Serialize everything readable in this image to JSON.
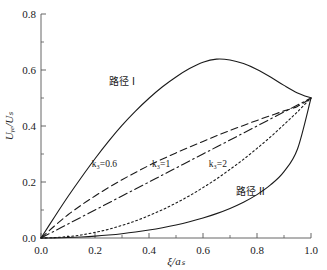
{
  "chart_data": {
    "type": "line",
    "title": "",
    "xlabel": "ξ/aₛ",
    "ylabel": "Uᵧₑ/Uₛ",
    "xlim": [
      0.0,
      1.0
    ],
    "ylim": [
      0.0,
      0.8
    ],
    "grid": false,
    "legend": "inline-annotations",
    "xticks": [
      "0.0",
      "0.2",
      "0.4",
      "0.6",
      "0.8",
      "1.0"
    ],
    "xtick_values": [
      0.0,
      0.2,
      0.4,
      0.6,
      0.8,
      1.0
    ],
    "yticks": [
      "0.0",
      "0.2",
      "0.4",
      "0.6",
      "0.8"
    ],
    "ytick_values": [
      0.0,
      0.2,
      0.4,
      0.6,
      0.8
    ],
    "x": [
      0.0,
      0.05,
      0.1,
      0.15,
      0.2,
      0.25,
      0.3,
      0.35,
      0.4,
      0.45,
      0.5,
      0.55,
      0.6,
      0.65,
      0.7,
      0.75,
      0.8,
      0.85,
      0.9,
      0.95,
      1.0
    ],
    "series": [
      {
        "name": "路径 I",
        "style": "solid",
        "color": "#1a1a1a",
        "values": [
          0.0,
          0.075,
          0.148,
          0.217,
          0.283,
          0.345,
          0.402,
          0.453,
          0.499,
          0.54,
          0.575,
          0.605,
          0.628,
          0.639,
          0.636,
          0.623,
          0.602,
          0.575,
          0.545,
          0.518,
          0.5
        ]
      },
      {
        "name": "k₃=0.6",
        "style": "dashed",
        "color": "#1a1a1a",
        "values": [
          0.0,
          0.043,
          0.083,
          0.118,
          0.15,
          0.18,
          0.208,
          0.234,
          0.259,
          0.282,
          0.304,
          0.325,
          0.345,
          0.365,
          0.384,
          0.402,
          0.42,
          0.437,
          0.454,
          0.47,
          0.5
        ]
      },
      {
        "name": "k₃=1",
        "style": "dash-dot",
        "color": "#1a1a1a",
        "values": [
          0.0,
          0.025,
          0.05,
          0.075,
          0.1,
          0.125,
          0.15,
          0.175,
          0.2,
          0.225,
          0.25,
          0.275,
          0.3,
          0.325,
          0.35,
          0.375,
          0.4,
          0.425,
          0.45,
          0.475,
          0.5
        ]
      },
      {
        "name": "k₃=2",
        "style": "dotted",
        "color": "#1a1a1a",
        "values": [
          0.0,
          0.0013,
          0.005,
          0.011,
          0.02,
          0.031,
          0.045,
          0.061,
          0.08,
          0.101,
          0.125,
          0.151,
          0.18,
          0.211,
          0.245,
          0.281,
          0.32,
          0.361,
          0.405,
          0.451,
          0.5
        ]
      },
      {
        "name": "路径 II",
        "style": "solid",
        "color": "#1a1a1a",
        "values": [
          0.0,
          0.0004,
          0.0016,
          0.0037,
          0.0066,
          0.0105,
          0.0153,
          0.0212,
          0.0283,
          0.0367,
          0.0465,
          0.058,
          0.0714,
          0.0871,
          0.1056,
          0.1278,
          0.155,
          0.1895,
          0.237,
          0.318,
          0.5
        ]
      }
    ],
    "annotations": [
      {
        "text": "路径 I",
        "x": 0.3,
        "y": 0.545,
        "kind": "path-label"
      },
      {
        "text": "k₃=0.6",
        "x": 0.235,
        "y": 0.255,
        "kind": "curve-label"
      },
      {
        "text": "k₃=1",
        "x": 0.445,
        "y": 0.255,
        "kind": "curve-label"
      },
      {
        "text": "k₃=2",
        "x": 0.655,
        "y": 0.255,
        "kind": "curve-label"
      },
      {
        "text": "路径 II",
        "x": 0.775,
        "y": 0.155,
        "kind": "path-label"
      }
    ]
  }
}
